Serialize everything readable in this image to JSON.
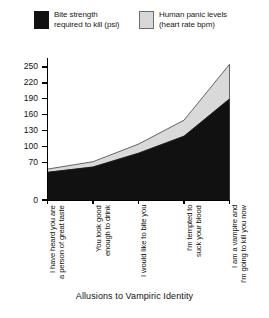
{
  "legend": {
    "items": [
      {
        "label": "Bite strength\nrequired to kill (psi)",
        "icon": "legend-swatch-black",
        "color": "#111111"
      },
      {
        "label": "Human panic levels\n(heart rate bpm)",
        "icon": "legend-swatch-gray",
        "color": "#d8d8d8"
      }
    ]
  },
  "axis_title": "Allusions to Vampiric Identity",
  "chart_data": {
    "type": "area",
    "stacked": true,
    "title": "",
    "xlabel": "Allusions to Vampiric Identity",
    "ylabel": "",
    "grid": false,
    "legend_position": "top",
    "categories": [
      "a person of great taste\nI have heard you are",
      "enough to drink\nYou look good",
      "I would like to bite you",
      "suck your blood\nI'm tempted to",
      "I'm going to kill you now\nI am a vampire and"
    ],
    "category_labels": [
      "I have heard you are\na person of great taste",
      "You look good\nenough to drink",
      "I would like to bite you",
      "I'm tempted to\nsuck your blood",
      "I am a vampire and\nI'm going to kill you now"
    ],
    "series": [
      {
        "name": "Bite strength required to kill (psi)",
        "color": "#111111",
        "values": [
          52,
          62,
          88,
          120,
          190
        ]
      },
      {
        "name": "Human panic levels (heart rate bpm)",
        "color": "#d8d8d8",
        "values": [
          6,
          10,
          17,
          30,
          65
        ]
      }
    ],
    "stacked_totals": [
      58,
      72,
      105,
      150,
      255
    ],
    "yticks": [
      0,
      70,
      100,
      130,
      160,
      190,
      220,
      250
    ],
    "ytick_labels": [
      "0",
      "70",
      "100",
      "130",
      "160",
      "190",
      "220",
      "250"
    ],
    "ylim": [
      0,
      265
    ],
    "xlim": [
      0,
      4
    ]
  }
}
